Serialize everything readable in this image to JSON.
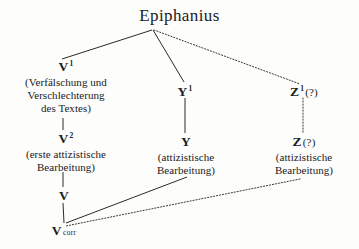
{
  "diagram": {
    "title": "Epiphanius",
    "type": "stemma-codicum",
    "background_color": "#fdfdfb",
    "ink_color": "#20201e",
    "nodes": [
      {
        "id": "epiphanius",
        "symbol": "Epiphanius",
        "gloss": []
      },
      {
        "id": "v1",
        "symbol": "V",
        "superscript": "1",
        "gloss": [
          "(Verfälschung und",
          "Verschlechterung",
          "des Textes)"
        ]
      },
      {
        "id": "v2",
        "symbol": "V",
        "superscript": "2",
        "gloss": [
          "(erste attizistische",
          "Bearbeitung)"
        ]
      },
      {
        "id": "v",
        "symbol": "V",
        "gloss": []
      },
      {
        "id": "vcorr",
        "symbol": "V",
        "suffix": "corr",
        "gloss": []
      },
      {
        "id": "y1",
        "symbol": "Y",
        "superscript": "1",
        "gloss": []
      },
      {
        "id": "y",
        "symbol": "Y",
        "gloss": [
          "(attizistische",
          "Bearbeitung)"
        ]
      },
      {
        "id": "z1",
        "symbol": "Z",
        "superscript": "1",
        "question": "(?)",
        "gloss": []
      },
      {
        "id": "z",
        "symbol": "Z",
        "question": "(?)",
        "gloss": [
          "(attizistische",
          "Bearbeitung)"
        ]
      }
    ],
    "edges": [
      {
        "from": "epiphanius",
        "to": "v1",
        "style": "solid",
        "x1": 152,
        "y1": 30,
        "x2": 62,
        "y2": 59
      },
      {
        "from": "epiphanius",
        "to": "y1",
        "style": "solid",
        "x1": 153,
        "y1": 30,
        "x2": 184,
        "y2": 82
      },
      {
        "from": "epiphanius",
        "to": "z1",
        "style": "dotted",
        "x1": 154,
        "y1": 30,
        "x2": 300,
        "y2": 84
      },
      {
        "from": "v1",
        "to": "v2",
        "style": "solid",
        "x1": 63,
        "y1": 118,
        "x2": 63,
        "y2": 130
      },
      {
        "from": "v2",
        "to": "v",
        "style": "solid",
        "x1": 63,
        "y1": 172,
        "x2": 63,
        "y2": 187
      },
      {
        "from": "v",
        "to": "vcorr",
        "style": "solid",
        "x1": 63,
        "y1": 203,
        "x2": 64,
        "y2": 223
      },
      {
        "from": "y1",
        "to": "y",
        "style": "solid",
        "x1": 185,
        "y1": 98,
        "x2": 185,
        "y2": 133
      },
      {
        "from": "z1",
        "to": "z",
        "style": "dotted",
        "x1": 303,
        "y1": 98,
        "x2": 303,
        "y2": 133
      },
      {
        "from": "y",
        "to": "vcorr",
        "style": "solid",
        "x1": 187,
        "y1": 177,
        "x2": 66,
        "y2": 223
      },
      {
        "from": "z",
        "to": "vcorr",
        "style": "dotted",
        "x1": 300,
        "y1": 179,
        "x2": 66,
        "y2": 226
      }
    ]
  }
}
